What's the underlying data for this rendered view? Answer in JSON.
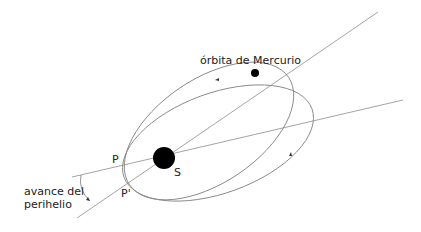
{
  "diagram": {
    "labels": {
      "orbit": "órbita de Mercurio",
      "perihelion": "P",
      "perihelion_prime": "P'",
      "sun": "S",
      "advance_line1": "avance del",
      "advance_line2": "perihelio"
    },
    "colors": {
      "line": "#9a9a9a",
      "body": "#000000",
      "text": "#222222"
    }
  }
}
